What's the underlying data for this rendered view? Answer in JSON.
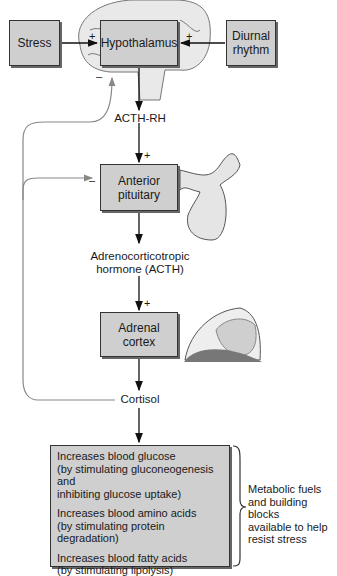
{
  "nodes": {
    "stress": "Stress",
    "hypothalamus": "Hypothalamus",
    "diurnal_line1": "Diurnal",
    "diurnal_line2": "rhythm",
    "anterior_line1": "Anterior",
    "anterior_line2": "pituitary",
    "adrenal": "Adrenal cortex"
  },
  "hormones": {
    "acth_rh": "ACTH-RH",
    "acth_line1": "Adrenocorticotropic",
    "acth_line2": "hormone (ACTH)",
    "cortisol": "Cortisol"
  },
  "signs": {
    "plus": "+",
    "minus": "–"
  },
  "effects": [
    {
      "line1": "Increases blood glucose",
      "line2": "(by stimulating gluconeogenesis and",
      "line3": "inhibiting glucose uptake)"
    },
    {
      "line1": "Increases blood amino acids",
      "line2": "(by stimulating protein degradation)"
    },
    {
      "line1": "Increases blood fatty acids",
      "line2": "(by stimulating lipolysis)"
    }
  ],
  "summary": {
    "line1": "Metabolic fuels",
    "line2": "and building blocks",
    "line3": "available to help",
    "line4": "resist stress"
  }
}
